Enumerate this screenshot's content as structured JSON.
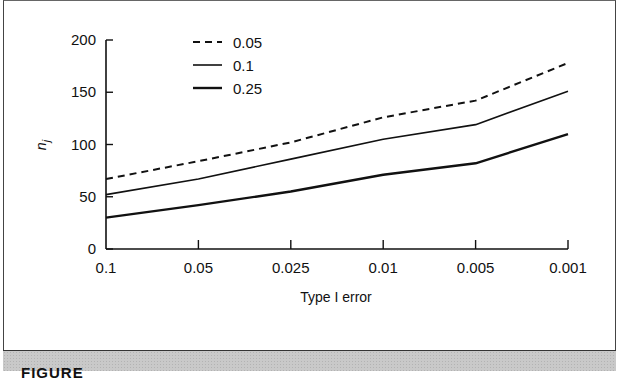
{
  "chart_data": {
    "type": "line",
    "title": "",
    "xlabel": "Type I error",
    "ylabel": "n_j",
    "ylabel_display": {
      "main": "n",
      "sub": "j"
    },
    "categories": [
      "0.1",
      "0.05",
      "0.025",
      "0.01",
      "0.005",
      "0.001"
    ],
    "yticks": [
      "0",
      "50",
      "100",
      "150",
      "200"
    ],
    "ylim": [
      0,
      200
    ],
    "grid": false,
    "legend_position": "top-left (inside)",
    "series": [
      {
        "name": "0.05",
        "style": "dashed",
        "width": 2,
        "values": [
          67,
          84,
          102,
          126,
          142,
          178
        ]
      },
      {
        "name": "0.1",
        "style": "solid",
        "width": 1.6,
        "values": [
          52,
          67,
          86,
          105,
          119,
          151
        ]
      },
      {
        "name": "0.25",
        "style": "solid",
        "width": 2.4,
        "values": [
          30,
          42,
          55,
          71,
          82,
          110
        ]
      }
    ]
  },
  "caption": {
    "label": "FIGURE"
  },
  "colors": {
    "line": "#111111",
    "caption_band": "#c9c9c9",
    "border": "#444444"
  }
}
